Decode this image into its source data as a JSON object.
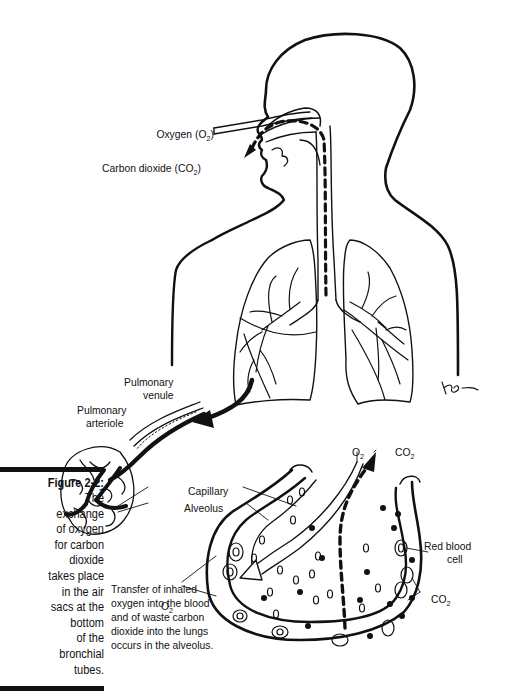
{
  "figure": {
    "number_label": "Figure 2-2:",
    "caption": "The exchange of oxygen for carbon dioxide takes place in the air sacs at the bottom of the bronchial tubes.",
    "caption_lines": [
      "The",
      "exchange",
      "of oxygen",
      "for carbon",
      "dioxide",
      "takes place",
      "in the air",
      "sacs at the",
      "bottom",
      "of the",
      "bronchial",
      "tubes."
    ]
  },
  "labels": {
    "oxygen": "Oxygen (O",
    "oxygen_sub": "2",
    "oxygen_close": ")",
    "carbon_dioxide": "Carbon dioxide (CO",
    "carbon_dioxide_sub": "2",
    "carbon_dioxide_close": ")",
    "pulmonary_venule_1": "Pulmonary",
    "pulmonary_venule_2": "venule",
    "pulmonary_arteriole_1": "Pulmonary",
    "pulmonary_arteriole_2": "arteriole",
    "capillary": "Capillary",
    "alveolus": "Alveolus",
    "o2_top": "O",
    "o2_top_sub": "2",
    "co2_top": "CO",
    "co2_top_sub": "2",
    "red_blood_cell_1": "Red blood",
    "red_blood_cell_2": "cell",
    "o2_left": "O",
    "o2_left_sub": "2",
    "co2_right": "CO",
    "co2_right_sub": "2",
    "artist_signature": "KB"
  },
  "note": "Transfer of inhaled\noxygen into the blood\nand of waste carbon\ndioxide into the lungs\noccurs in the alveolus.",
  "colors": {
    "ink": "#111111",
    "background": "#ffffff"
  }
}
